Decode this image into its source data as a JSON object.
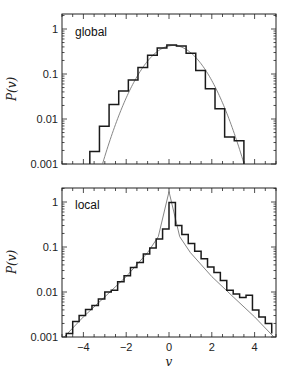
{
  "chart_data": [
    {
      "type": "line",
      "subtype": "histogram_with_fit",
      "panel_label": "global",
      "xlabel": "v",
      "ylabel": "P(v)",
      "yscale": "log",
      "xlim": [
        -5,
        5
      ],
      "ylim": [
        0.001,
        2.1
      ],
      "yticks": [
        1,
        0.1,
        0.01,
        0.001
      ],
      "ytick_labels": [
        "1",
        "0.1",
        "0.01",
        "0.001"
      ],
      "xticks": [
        -4,
        -2,
        0,
        2,
        4
      ],
      "xtick_labels": [],
      "grid": false,
      "histogram": {
        "name": "histogram",
        "bin_edges": [
          -3.7,
          -3.25,
          -2.8,
          -2.35,
          -1.9,
          -1.45,
          -1.0,
          -0.55,
          -0.1,
          0.35,
          0.8,
          1.25,
          1.7,
          2.15,
          2.6,
          3.05,
          3.5
        ],
        "values": [
          0.0019,
          0.0069,
          0.021,
          0.042,
          0.074,
          0.14,
          0.26,
          0.38,
          0.44,
          0.42,
          0.29,
          0.12,
          0.047,
          0.017,
          0.004,
          0.0033
        ]
      },
      "fit": {
        "name": "gaussian fit",
        "type": "gaussian",
        "peak": 0.43,
        "mean": 0.2,
        "sigma": 0.95,
        "x": [
          -3.4,
          -3.0,
          -2.5,
          -2.0,
          -1.5,
          -1.0,
          -0.5,
          0.0,
          0.2,
          0.5,
          1.0,
          1.5,
          2.0,
          2.5,
          3.0,
          3.3
        ],
        "values": [
          0.001,
          0.0027,
          0.0096,
          0.029,
          0.073,
          0.15,
          0.26,
          0.42,
          0.43,
          0.41,
          0.3,
          0.17,
          0.075,
          0.026,
          0.0072,
          0.0034
        ]
      }
    },
    {
      "type": "line",
      "subtype": "histogram_with_fit",
      "panel_label": "local",
      "xlabel": "v",
      "ylabel": "P(v)",
      "yscale": "log",
      "xlim": [
        -5,
        5
      ],
      "ylim": [
        0.001,
        2.1
      ],
      "yticks": [
        1,
        0.1,
        0.01,
        0.001
      ],
      "ytick_labels": [
        "1",
        "0.1",
        "0.01",
        "0.001"
      ],
      "xticks": [
        -4,
        -2,
        0,
        2,
        4
      ],
      "xtick_labels": [
        "−4",
        "−2",
        "0",
        "2",
        "4"
      ],
      "grid": false,
      "histogram": {
        "name": "histogram",
        "bin_edges": [
          -4.8,
          -4.5,
          -4.2,
          -3.9,
          -3.6,
          -3.3,
          -3.0,
          -2.7,
          -2.4,
          -2.1,
          -1.8,
          -1.5,
          -1.2,
          -0.9,
          -0.6,
          -0.3,
          0.0,
          0.3,
          0.6,
          0.9,
          1.2,
          1.5,
          1.8,
          2.1,
          2.4,
          2.7,
          3.0,
          3.3,
          3.6,
          3.9,
          4.2,
          4.5,
          4.8
        ],
        "values": [
          0.0012,
          0.0022,
          0.003,
          0.0041,
          0.005,
          0.007,
          0.01,
          0.011,
          0.017,
          0.023,
          0.035,
          0.045,
          0.07,
          0.095,
          0.15,
          0.25,
          0.98,
          0.3,
          0.19,
          0.12,
          0.08,
          0.055,
          0.036,
          0.027,
          0.018,
          0.011,
          0.009,
          0.0075,
          0.0085,
          0.004,
          0.0028,
          0.002,
          0.0012
        ]
      },
      "fit": {
        "name": "exponential fit",
        "type": "two-sided exponential",
        "x": [
          -4.9,
          -4.0,
          -3.0,
          -2.0,
          -1.0,
          -0.5,
          0.0,
          0.5,
          1.0,
          2.0,
          3.0,
          4.0,
          4.9
        ],
        "values": [
          0.00085,
          0.0028,
          0.0078,
          0.022,
          0.075,
          0.17,
          1.7,
          0.17,
          0.075,
          0.022,
          0.0078,
          0.0028,
          0.00085
        ]
      }
    }
  ],
  "panels": {
    "top": {
      "label": "global",
      "ylabel": "P(v)"
    },
    "bottom": {
      "label": "local",
      "ylabel": "P(v)",
      "xlabel": "v"
    }
  },
  "colors": {
    "histogram": "#1a1a1a",
    "fit": "#777777",
    "axes": "#222222"
  }
}
